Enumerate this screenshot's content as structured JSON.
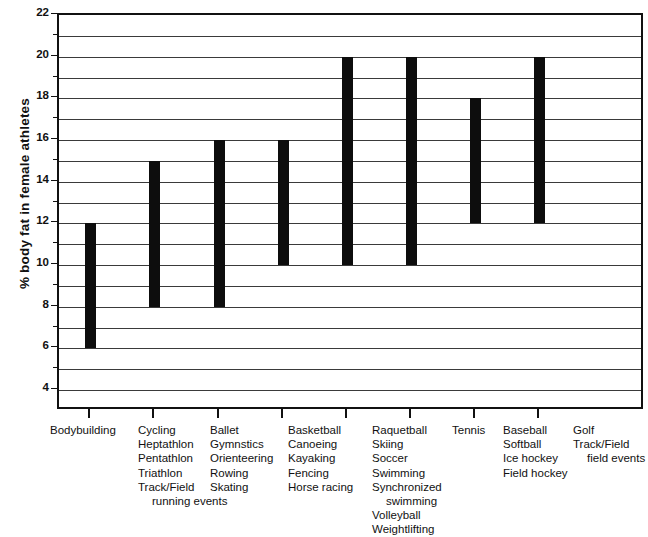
{
  "chart_data": {
    "type": "bar",
    "title": "",
    "subtitle": "",
    "xlabel": "",
    "ylabel": "% body fat in female athletes",
    "ylim": [
      3,
      22
    ],
    "ytick_labels": [
      "22",
      "20",
      "18",
      "16",
      "14",
      "12",
      "10",
      "8",
      "6",
      "4"
    ],
    "ytick_values": [
      22,
      20,
      18,
      16,
      14,
      12,
      10,
      8,
      6,
      4
    ],
    "gridlines": [
      22,
      21,
      20,
      19,
      18,
      17,
      16,
      15,
      14,
      13,
      12,
      11,
      10,
      9,
      8,
      7,
      6,
      5,
      4
    ],
    "grid": true,
    "legend": "none",
    "bar_style": "floating-range",
    "bar_color": "#0d0d0d",
    "categories": [
      "Bodybuilding",
      "Cycling / Heptathlon / Pentathlon / Triathlon / Track/Field running events",
      "Ballet / Gymnstics / Orienteering / Rowing / Skating",
      "Basketball / Canoeing / Kayaking / Fencing / Horse racing",
      "Raquetball / Skiing / Soccer / Swimming / Synchronized swimming / Volleyball / Weightlifting",
      "Tennis",
      "Baseball / Softball / Ice hockey / Field hockey",
      "Golf / Track/Field field events"
    ],
    "series": [
      {
        "name": "% body fat range",
        "low": [
          6,
          8,
          8,
          10,
          10,
          10,
          12,
          12
        ],
        "high": [
          12,
          15,
          16,
          16,
          20,
          20,
          18,
          20
        ]
      }
    ],
    "groups": [
      {
        "id": "bodybuilding",
        "low": 6,
        "high": 12,
        "lines": [
          "Bodybuilding"
        ],
        "continuation": []
      },
      {
        "id": "cycling-group",
        "low": 8,
        "high": 15,
        "lines": [
          "Cycling",
          "Heptathlon",
          "Pentathlon",
          "Triathlon",
          "Track/Field"
        ],
        "continuation": [
          "running events"
        ]
      },
      {
        "id": "ballet-group",
        "low": 8,
        "high": 16,
        "lines": [
          "Ballet",
          "Gymnstics",
          "Orienteering",
          "Rowing",
          "Skating"
        ],
        "continuation": []
      },
      {
        "id": "basketball-group",
        "low": 10,
        "high": 16,
        "lines": [
          "Basketball",
          "Canoeing",
          "Kayaking",
          "Fencing",
          "Horse racing"
        ],
        "continuation": []
      },
      {
        "id": "raquetball-group",
        "low": 10,
        "high": 20,
        "lines": [
          "Raquetball",
          "Skiing",
          "Soccer",
          "Swimming",
          "Synchronized"
        ],
        "continuation": [
          "swimming"
        ],
        "lines_after": [
          "Volleyball",
          "Weightlifting"
        ]
      },
      {
        "id": "tennis",
        "low": 10,
        "high": 20,
        "lines": [
          "Tennis"
        ],
        "continuation": []
      },
      {
        "id": "baseball-group",
        "low": 12,
        "high": 18,
        "lines": [
          "Baseball",
          "Softball",
          "Ice hockey",
          "Field hockey"
        ],
        "continuation": []
      },
      {
        "id": "golf-group",
        "low": 12,
        "high": 20,
        "lines": [
          "Golf",
          "Track/Field"
        ],
        "continuation": [
          "field events"
        ]
      }
    ]
  }
}
